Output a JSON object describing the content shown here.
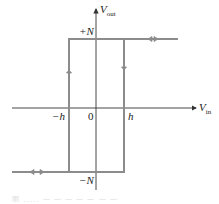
{
  "diagram": {
    "type": "hysteresis-loop",
    "axes": {
      "y_label": "V",
      "y_label_sub": "out",
      "x_label": "V",
      "x_label_sub": "in",
      "origin_label": "0"
    },
    "levels": {
      "high": "+N",
      "low": "−N"
    },
    "thresholds": {
      "negative": "−h",
      "positive": "h"
    },
    "colors": {
      "axis": "#333333",
      "loop": "#8c8c8c",
      "text": "#222222"
    }
  },
  "caption": {
    "text": "图 ..... 一 一 一 一 一 一 一"
  }
}
